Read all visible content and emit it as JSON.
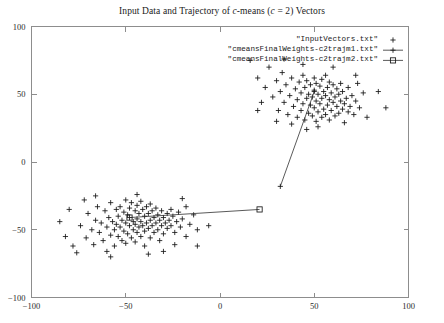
{
  "chart_data": {
    "type": "scatter",
    "title": "Input Data and Trajectory of c-means (c = 2) Vectors",
    "title_parts": {
      "prefix": "Input Data and Trajectory of ",
      "italic_c1": "c",
      "middle": "-means (",
      "italic_c2": "c",
      "suffix": " = 2) Vectors"
    },
    "xlabel": "",
    "ylabel": "",
    "xlim": [
      -100,
      100
    ],
    "ylim": [
      -100,
      100
    ],
    "xticks": [
      -100,
      -50,
      0,
      50,
      100
    ],
    "yticks": [
      -100,
      -50,
      0,
      50,
      100
    ],
    "xtick_labels": [
      "-100",
      "-50",
      "0",
      "50",
      "100"
    ],
    "ytick_labels": [
      "-100",
      "-50",
      "0",
      "50",
      "100"
    ],
    "grid": false,
    "legend_position": "top-right",
    "legend": [
      {
        "label": "\"InputVectors.txt\"",
        "marker": "plus",
        "line": false
      },
      {
        "label": "\"cmeansFinalWeights-c2trajm1.txt\"",
        "marker": "cross",
        "line": true
      },
      {
        "label": "\"cmeansFinalWeights-c2trajm2.txt\"",
        "marker": "square",
        "line": true
      }
    ],
    "series": [
      {
        "name": "\"InputVectors.txt\"",
        "marker": "plus",
        "points": [
          [
            -78,
            -62
          ],
          [
            -74,
            -47
          ],
          [
            -71,
            -56
          ],
          [
            -70,
            -38
          ],
          [
            -68,
            -50
          ],
          [
            -67,
            -61
          ],
          [
            -66,
            -43
          ],
          [
            -65,
            -33
          ],
          [
            -64,
            -52
          ],
          [
            -63,
            -45
          ],
          [
            -62,
            -58
          ],
          [
            -61,
            -36
          ],
          [
            -60,
            -48
          ],
          [
            -60,
            -66
          ],
          [
            -59,
            -41
          ],
          [
            -58,
            -54
          ],
          [
            -58,
            -30
          ],
          [
            -57,
            -44
          ],
          [
            -56,
            -50
          ],
          [
            -56,
            -62
          ],
          [
            -55,
            -35
          ],
          [
            -55,
            -46
          ],
          [
            -54,
            -40
          ],
          [
            -54,
            -55
          ],
          [
            -53,
            -33
          ],
          [
            -53,
            -48
          ],
          [
            -52,
            -43
          ],
          [
            -52,
            -58
          ],
          [
            -51,
            -37
          ],
          [
            -51,
            -51
          ],
          [
            -50,
            -28
          ],
          [
            -50,
            -45
          ],
          [
            -50,
            -60
          ],
          [
            -49,
            -39
          ],
          [
            -49,
            -53
          ],
          [
            -48,
            -34
          ],
          [
            -48,
            -47
          ],
          [
            -48,
            -41
          ],
          [
            -47,
            -56
          ],
          [
            -47,
            -30
          ],
          [
            -46,
            -44
          ],
          [
            -46,
            -50
          ],
          [
            -45,
            -36
          ],
          [
            -45,
            -46
          ],
          [
            -45,
            -59
          ],
          [
            -44,
            -32
          ],
          [
            -44,
            -42
          ],
          [
            -44,
            -52
          ],
          [
            -43,
            -38
          ],
          [
            -43,
            -48
          ],
          [
            -42,
            -29
          ],
          [
            -42,
            -44
          ],
          [
            -42,
            -55
          ],
          [
            -41,
            -35
          ],
          [
            -41,
            -47
          ],
          [
            -40,
            -40
          ],
          [
            -40,
            -51
          ],
          [
            -40,
            -62
          ],
          [
            -39,
            -33
          ],
          [
            -39,
            -45
          ],
          [
            -38,
            -38
          ],
          [
            -38,
            -49
          ],
          [
            -37,
            -31
          ],
          [
            -37,
            -43
          ],
          [
            -37,
            -56
          ],
          [
            -36,
            -36
          ],
          [
            -36,
            -47
          ],
          [
            -35,
            -41
          ],
          [
            -35,
            -52
          ],
          [
            -34,
            -34
          ],
          [
            -34,
            -45
          ],
          [
            -33,
            -39
          ],
          [
            -33,
            -50
          ],
          [
            -32,
            -43
          ],
          [
            -32,
            -58
          ],
          [
            -31,
            -36
          ],
          [
            -31,
            -47
          ],
          [
            -30,
            -41
          ],
          [
            -30,
            -53
          ],
          [
            -29,
            -45
          ],
          [
            -28,
            -38
          ],
          [
            -28,
            -49
          ],
          [
            -27,
            -43
          ],
          [
            -26,
            -35
          ],
          [
            -26,
            -47
          ],
          [
            -25,
            -40
          ],
          [
            -24,
            -52
          ],
          [
            -23,
            -44
          ],
          [
            -22,
            -37
          ],
          [
            -21,
            -48
          ],
          [
            -20,
            -42
          ],
          [
            -18,
            -55
          ],
          [
            -16,
            -46
          ],
          [
            -14,
            -39
          ],
          [
            -12,
            -50
          ],
          [
            -85,
            -44
          ],
          [
            -82,
            -55
          ],
          [
            -80,
            -35
          ],
          [
            -76,
            -67
          ],
          [
            -72,
            -28
          ],
          [
            -30,
            -66
          ],
          [
            -24,
            -61
          ],
          [
            -18,
            -33
          ],
          [
            -12,
            -62
          ],
          [
            -6,
            -47
          ],
          [
            -66,
            -25
          ],
          [
            -58,
            -70
          ],
          [
            -44,
            -24
          ],
          [
            -38,
            -68
          ],
          [
            -20,
            -27
          ],
          [
            20,
            62
          ],
          [
            24,
            55
          ],
          [
            26,
            70
          ],
          [
            28,
            48
          ],
          [
            30,
            60
          ],
          [
            31,
            38
          ],
          [
            32,
            52
          ],
          [
            33,
            66
          ],
          [
            34,
            44
          ],
          [
            35,
            57
          ],
          [
            36,
            35
          ],
          [
            37,
            49
          ],
          [
            38,
            62
          ],
          [
            39,
            41
          ],
          [
            40,
            54
          ],
          [
            41,
            33
          ],
          [
            41,
            46
          ],
          [
            42,
            59
          ],
          [
            43,
            38
          ],
          [
            43,
            51
          ],
          [
            44,
            64
          ],
          [
            44,
            43
          ],
          [
            45,
            55
          ],
          [
            45,
            31
          ],
          [
            46,
            47
          ],
          [
            46,
            60
          ],
          [
            47,
            36
          ],
          [
            47,
            50
          ],
          [
            48,
            42
          ],
          [
            48,
            57
          ],
          [
            49,
            34
          ],
          [
            49,
            48
          ],
          [
            50,
            62
          ],
          [
            50,
            40
          ],
          [
            50,
            53
          ],
          [
            51,
            30
          ],
          [
            51,
            45
          ],
          [
            51,
            58
          ],
          [
            52,
            37
          ],
          [
            52,
            50
          ],
          [
            53,
            43
          ],
          [
            53,
            56
          ],
          [
            54,
            33
          ],
          [
            54,
            47
          ],
          [
            54,
            61
          ],
          [
            55,
            39
          ],
          [
            55,
            52
          ],
          [
            56,
            35
          ],
          [
            56,
            49
          ],
          [
            56,
            64
          ],
          [
            57,
            42
          ],
          [
            57,
            55
          ],
          [
            58,
            31
          ],
          [
            58,
            46
          ],
          [
            58,
            59
          ],
          [
            59,
            38
          ],
          [
            59,
            51
          ],
          [
            60,
            44
          ],
          [
            60,
            57
          ],
          [
            61,
            34
          ],
          [
            61,
            48
          ],
          [
            62,
            41
          ],
          [
            62,
            54
          ],
          [
            63,
            36
          ],
          [
            63,
            50
          ],
          [
            64,
            45
          ],
          [
            64,
            58
          ],
          [
            65,
            39
          ],
          [
            65,
            52
          ],
          [
            66,
            43
          ],
          [
            67,
            47
          ],
          [
            68,
            37
          ],
          [
            68,
            55
          ],
          [
            69,
            41
          ],
          [
            70,
            49
          ],
          [
            71,
            35
          ],
          [
            72,
            45
          ],
          [
            73,
            58
          ],
          [
            74,
            40
          ],
          [
            76,
            51
          ],
          [
            16,
            75
          ],
          [
            22,
            44
          ],
          [
            34,
            76
          ],
          [
            38,
            28
          ],
          [
            44,
            72
          ],
          [
            52,
            26
          ],
          [
            60,
            70
          ],
          [
            66,
            29
          ],
          [
            72,
            64
          ],
          [
            78,
            33
          ],
          [
            84,
            52
          ],
          [
            88,
            40
          ],
          [
            46,
            24
          ],
          [
            30,
            30
          ],
          [
            20,
            38
          ]
        ]
      }
    ],
    "trajectories": [
      {
        "name": "\"cmeansFinalWeights-c2trajm1.txt\"",
        "marker": "cross",
        "points": [
          [
            32,
            -18
          ],
          [
            50,
            52
          ]
        ]
      },
      {
        "name": "\"cmeansFinalWeights-c2trajm2.txt\"",
        "marker": "square",
        "points": [
          [
            -48,
            -41
          ],
          [
            21,
            -35
          ]
        ]
      }
    ],
    "colors": {
      "axis": "#8d8d8d",
      "data": "#171717",
      "trajectory": "#303030",
      "background": "#ffffff",
      "text": "#1a1a1a"
    }
  }
}
